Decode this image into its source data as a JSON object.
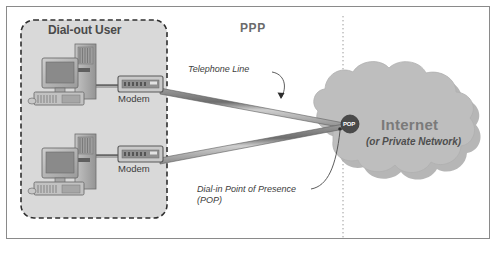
{
  "diagram": {
    "zones": {
      "dialout_user_label": "Dial-out User",
      "ppp_label": "PPP",
      "internet_label": "Internet",
      "internet_sub_label": "(or Private Network)"
    },
    "nodes": {
      "modem_top_label": "Modem",
      "modem_bottom_label": "Modem",
      "pop_badge_label": "POP"
    },
    "callouts": {
      "telephone_line": "Telephone Line",
      "pop_line1": "Dial-in Point of Presence",
      "pop_line2": "(POP)"
    },
    "colors": {
      "page_background": "#ffffff",
      "frame_border": "#8a8a8a",
      "zone_fill": "#d8d8d8",
      "zone_dash_border": "#2f2f2f",
      "cloud_fill": "#bdbdbd",
      "cloud_shadow": "#a8a8a8",
      "line_dark": "#5a5a5a",
      "line_light": "#c9c9c9",
      "pop_badge_fill": "#4a4a4a",
      "divider": "#9a9a9a",
      "device_body": "#b8b8b8",
      "device_dark": "#7d7d7d",
      "device_screen": "#8c8c8c"
    }
  }
}
